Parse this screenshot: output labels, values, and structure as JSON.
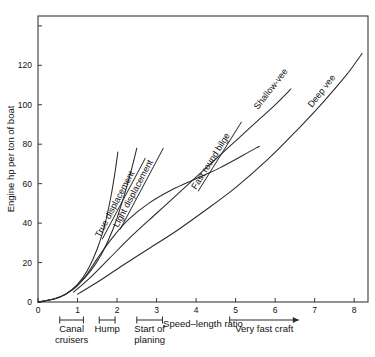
{
  "chart_data": {
    "type": "line",
    "title": "",
    "xlabel": "Speed–length ratio",
    "ylabel": "Engine hp per ton of boat",
    "xlim": [
      0,
      8.35
    ],
    "ylim": [
      0,
      145
    ],
    "xticks": [
      "0",
      "1",
      "2",
      "3",
      "4",
      "5",
      "6",
      "7",
      "8"
    ],
    "xtick_values": [
      0,
      1,
      2,
      3,
      4,
      5,
      6,
      7,
      8
    ],
    "yticks": [
      "0",
      "20",
      "40",
      "60",
      "80",
      "100",
      "120"
    ],
    "ytick_values": [
      0,
      20,
      40,
      60,
      80,
      100,
      120
    ],
    "grid": false,
    "legend": "none (inline rotated curve labels with underline leader lines)",
    "series": [
      {
        "name": "True displacement",
        "label_rotation_deg": -62,
        "points": [
          [
            0.0,
            0.0
          ],
          [
            0.4,
            1.5
          ],
          [
            0.7,
            4.0
          ],
          [
            1.0,
            9.0
          ],
          [
            1.25,
            16.0
          ],
          [
            1.5,
            27.0
          ],
          [
            1.7,
            40.0
          ],
          [
            1.85,
            54.0
          ],
          [
            1.95,
            66.0
          ],
          [
            2.02,
            76.0
          ]
        ]
      },
      {
        "name": "Light displacement",
        "label_rotation_deg": -62,
        "points": [
          [
            0.0,
            0.0
          ],
          [
            0.4,
            1.5
          ],
          [
            0.7,
            4.0
          ],
          [
            1.0,
            8.5
          ],
          [
            1.3,
            15.0
          ],
          [
            1.6,
            24.0
          ],
          [
            1.9,
            37.0
          ],
          [
            2.15,
            52.0
          ],
          [
            2.35,
            66.0
          ],
          [
            2.5,
            78.0
          ]
        ]
      },
      {
        "name": "Fast round bilge",
        "label_rotation_deg": -58,
        "points": [
          [
            0.0,
            0.0
          ],
          [
            0.5,
            2.0
          ],
          [
            0.9,
            6.5
          ],
          [
            1.2,
            13.0
          ],
          [
            1.5,
            22.0
          ],
          [
            1.9,
            33.0
          ],
          [
            2.3,
            42.0
          ],
          [
            2.8,
            50.0
          ],
          [
            3.4,
            57.0
          ],
          [
            4.0,
            62.5
          ],
          [
            4.6,
            68.0
          ],
          [
            5.2,
            74.5
          ],
          [
            5.6,
            79.0
          ]
        ]
      },
      {
        "name": "Shallow-vee",
        "label_rotation_deg": -52,
        "points": [
          [
            0.9,
            5.0
          ],
          [
            1.3,
            12.0
          ],
          [
            1.8,
            22.0
          ],
          [
            2.4,
            34.0
          ],
          [
            3.0,
            45.0
          ],
          [
            3.6,
            56.0
          ],
          [
            4.2,
            67.0
          ],
          [
            4.8,
            78.0
          ],
          [
            5.4,
            89.0
          ],
          [
            6.0,
            100.0
          ],
          [
            6.4,
            108.0
          ]
        ]
      },
      {
        "name": "Deep vee",
        "label_rotation_deg": -52,
        "points": [
          [
            1.0,
            4.0
          ],
          [
            1.5,
            10.0
          ],
          [
            2.1,
            18.0
          ],
          [
            2.8,
            27.0
          ],
          [
            3.5,
            36.0
          ],
          [
            4.2,
            46.0
          ],
          [
            5.0,
            58.0
          ],
          [
            5.8,
            72.0
          ],
          [
            6.5,
            86.0
          ],
          [
            7.2,
            101.0
          ],
          [
            7.8,
            115.0
          ],
          [
            8.2,
            126.0
          ]
        ]
      }
    ],
    "annotations": [
      {
        "text": "Canal cruisers",
        "type": "bracket",
        "x_start": 0.55,
        "x_end": 1.15,
        "lines": [
          "Canal",
          "cruisers"
        ]
      },
      {
        "text": "Hump",
        "type": "bracket",
        "x_start": 1.55,
        "x_end": 1.95,
        "lines": [
          "Hump"
        ]
      },
      {
        "text": "Start of planing",
        "type": "bracket",
        "x_start": 2.5,
        "x_end": 3.15,
        "lines": [
          "Start of",
          "planing"
        ]
      },
      {
        "text": "Very fast craft",
        "type": "arrow",
        "x_start": 4.85,
        "x_end": 6.6,
        "lines": [
          "Very fast craft"
        ]
      }
    ]
  },
  "colors": {
    "curve": "#2b2b2b",
    "frame": "#3a3a3a",
    "text": "#111111",
    "background": "#ffffff"
  }
}
